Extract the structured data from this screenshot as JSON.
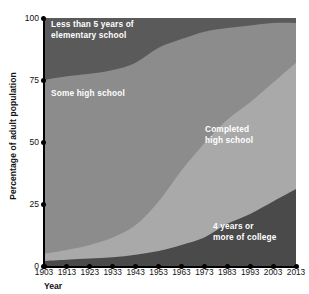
{
  "chart_data": {
    "type": "area",
    "stacked": true,
    "title": "",
    "xlabel": "Year",
    "ylabel": "Percentage of adult population",
    "categories": [
      1903,
      1913,
      1923,
      1933,
      1943,
      1953,
      1963,
      1973,
      1983,
      1993,
      2003,
      2013
    ],
    "x_tick_labels": [
      "1903",
      "1913",
      "1923",
      "1933",
      "1943",
      "1953",
      "1963",
      "1973",
      "1983",
      "1993",
      "2003",
      "2013"
    ],
    "y_tick_labels": [
      "0",
      "25",
      "50",
      "75",
      "100"
    ],
    "y_ticks": [
      0,
      25,
      50,
      75,
      100
    ],
    "ylim": [
      0,
      100
    ],
    "grid": false,
    "legend_position": "inline-area-labels",
    "series": [
      {
        "name": "4 years or more of college",
        "label": "4 years or\nmore of college",
        "color": "#4a4a4a",
        "order": 1,
        "values": [
          2,
          2.5,
          3,
          3.5,
          4.5,
          6,
          8.5,
          11.5,
          17,
          21,
          26,
          31
        ]
      },
      {
        "name": "Completed high school",
        "label": "Completed\nhigh school",
        "color": "#a9a9a9",
        "order": 2,
        "values": [
          3,
          4,
          5.5,
          8,
          12,
          20,
          30,
          38,
          42,
          45,
          48,
          51
        ]
      },
      {
        "name": "Some high school",
        "label": "Some high school",
        "color": "#8c8c8c",
        "order": 3,
        "values": [
          70,
          70,
          69,
          67.5,
          65.5,
          62,
          53,
          45,
          37,
          31,
          24,
          16
        ]
      },
      {
        "name": "Less than 5 years of elementary school",
        "label": "Less than 5 years of\nelementary school",
        "color": "#5a5a5a",
        "order": 4,
        "values": [
          25,
          23.5,
          22.5,
          21,
          18,
          12,
          8.5,
          5.5,
          4,
          3,
          2,
          2
        ]
      }
    ],
    "cumulative_top_boundaries": {
      "college": [
        2,
        2.5,
        3,
        3.5,
        4.5,
        6,
        8.5,
        11.5,
        17,
        21,
        26,
        31
      ],
      "completed_hs": [
        5,
        6.5,
        8.5,
        11.5,
        16.5,
        26,
        38.5,
        49.5,
        59,
        66,
        74,
        82
      ],
      "some_hs": [
        75,
        76.5,
        77.5,
        79,
        82,
        88,
        91.5,
        94.5,
        96,
        97,
        98,
        98
      ],
      "elementary": [
        100,
        100,
        100,
        100,
        100,
        100,
        100,
        100,
        100,
        100,
        100,
        100
      ]
    }
  },
  "axis": {
    "y_title": "Percentage of adult population",
    "x_title": "Year"
  },
  "colors": {
    "background": "#ffffff",
    "axis": "#000000",
    "text": "#111111",
    "label_text": "#ffffff",
    "elementary": "#5a5a5a",
    "some_high_school": "#8c8c8c",
    "completed_high_school": "#a9a9a9",
    "college": "#4a4a4a"
  }
}
